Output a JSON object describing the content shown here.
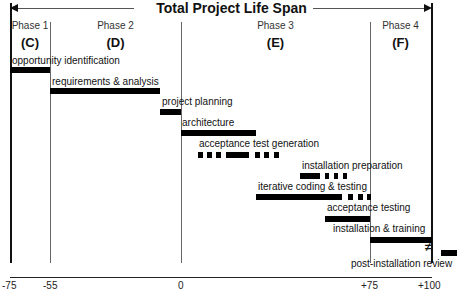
{
  "title": "Total Project Life Span",
  "phases": [
    {
      "name": "Phase 1",
      "code": "(C)"
    },
    {
      "name": "Phase 2",
      "code": "(D)"
    },
    {
      "name": "Phase 3",
      "code": "(E)"
    },
    {
      "name": "Phase 4",
      "code": "(F)"
    }
  ],
  "activities": [
    {
      "label": "opportunity identification",
      "start": -75,
      "end": -55,
      "style": "solid"
    },
    {
      "label": "requirements & analysis",
      "start": -55,
      "end": -10,
      "style": "solid"
    },
    {
      "label": "project planning",
      "start": -10,
      "end": 0,
      "style": "solid"
    },
    {
      "label": "architecture",
      "start": 0,
      "end": 28,
      "style": "solid"
    },
    {
      "label": "acceptance test generation",
      "start": 6,
      "end": 40,
      "style": "dashed"
    },
    {
      "label": "installation preparation",
      "start": 47,
      "end": 62,
      "style": "dashed"
    },
    {
      "label": "iterative coding & testing",
      "start": 28,
      "end": 75,
      "style": "solid-then-dashed"
    },
    {
      "label": "acceptance testing",
      "start": 60,
      "end": 75,
      "style": "solid"
    },
    {
      "label": "installation & training",
      "start": 75,
      "end": 100,
      "style": "solid"
    },
    {
      "label": "post-installation review",
      "start": 102,
      "end": 108,
      "style": "solid"
    }
  ],
  "axis": {
    "ticks": [
      "-75",
      "-55",
      "0",
      "+75",
      "+100"
    ]
  },
  "break_symbol": "≠"
}
